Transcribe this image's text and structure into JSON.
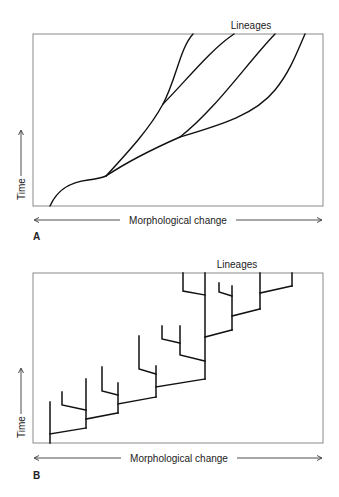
{
  "panels": [
    {
      "id": "A",
      "letter": "A",
      "top_label": "Lineages",
      "x_axis_label": "Morphological change",
      "y_axis_label": "Time",
      "model": "gradual-divergence",
      "branch_count": 4
    },
    {
      "id": "B",
      "letter": "B",
      "top_label": "Lineages",
      "x_axis_label": "Morphological change",
      "y_axis_label": "Time",
      "model": "punctuated-branching",
      "branch_count": 13
    }
  ],
  "colors": {
    "line": "#111111",
    "frame": "#8a8a8a",
    "text": "#222222",
    "background": "#ffffff"
  }
}
